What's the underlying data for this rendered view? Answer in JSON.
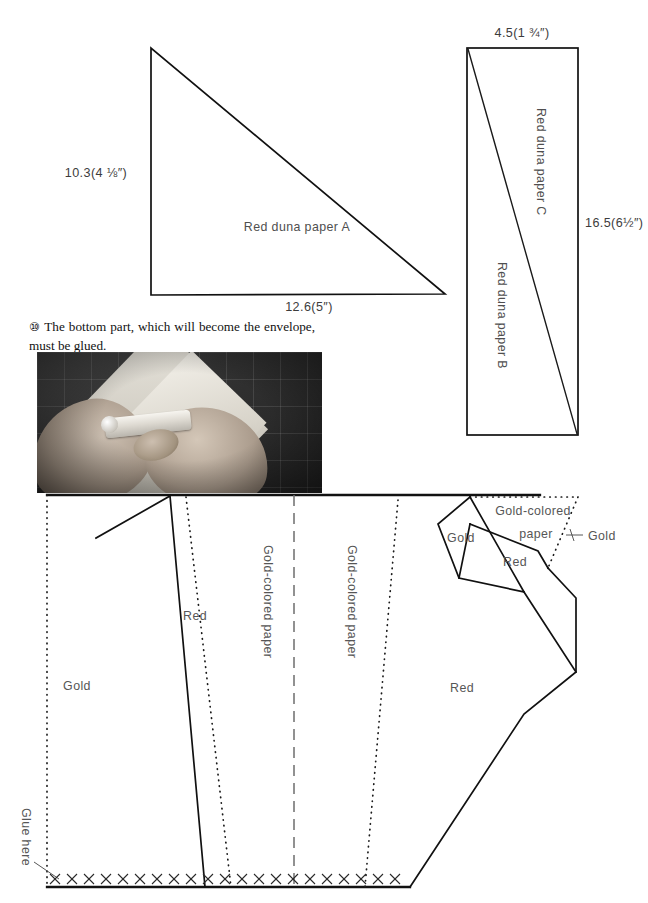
{
  "page": {
    "width": 648,
    "height": 903
  },
  "patterns": {
    "triangle_a": {
      "label": "Red duna paper A",
      "height_dim": "10.3(4 ⅛″)",
      "base_dim": "12.6(5″)"
    },
    "rectangle_bc": {
      "top_dim": "4.5(1 ¾″)",
      "side_dim": "16.5(6½″)",
      "upper_label": "Red duna paper C",
      "lower_label": "Red duna paper B"
    }
  },
  "caption": {
    "marker": "⑩",
    "text": "The bottom part, which will become the envelope, must be glued."
  },
  "photo": {
    "alt": "Hands applying glue stick to a folded paper sheet on a cutting mat"
  },
  "layout_diagram": {
    "zones": [
      {
        "id": "gold-left",
        "label": "Gold"
      },
      {
        "id": "red-left",
        "label": "Red"
      },
      {
        "id": "gold-paper-left",
        "label": "Gold-colored paper"
      },
      {
        "id": "gold-paper-right",
        "label": "Gold-colored paper"
      },
      {
        "id": "red-center",
        "label": "Red"
      },
      {
        "id": "gold-facet",
        "label": "Gold"
      },
      {
        "id": "gold-colored-facet-line1",
        "label": "Gold-colored"
      },
      {
        "id": "gold-colored-facet-line2",
        "label": "paper"
      },
      {
        "id": "red-facet",
        "label": "Red"
      },
      {
        "id": "gold-strip",
        "label": "Gold"
      }
    ],
    "glue_tab": {
      "label": "Glue here",
      "x_mark_count": 21
    }
  },
  "colors": {
    "ink": "#111111",
    "label_gray": "#4f4f4f",
    "fold_dash": "#6e6e6e",
    "paper": "#ffffff"
  }
}
